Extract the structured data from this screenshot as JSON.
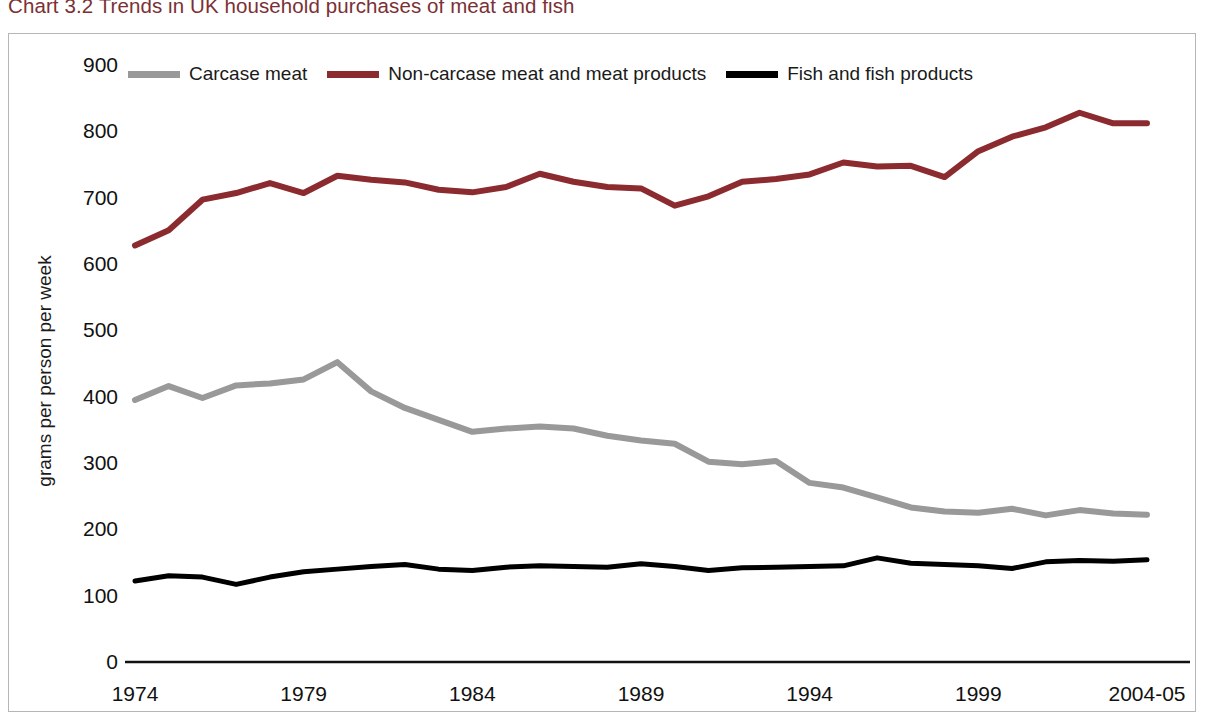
{
  "title": "Chart 3.2 Trends in UK household purchases of meat and fish",
  "title_color": "#7B3034",
  "legend": {
    "position": "top",
    "entries": [
      {
        "label": "Carcase meat",
        "color": "#999999"
      },
      {
        "label": "Non-carcase meat and meat products",
        "color": "#8C2B2F"
      },
      {
        "label": "Fish and fish products",
        "color": "#000000"
      }
    ]
  },
  "axes": {
    "ylabel": "grams per person per week",
    "xlabel": "",
    "y_ticks": [
      "900",
      "800",
      "700",
      "600",
      "500",
      "400",
      "300",
      "200",
      "100",
      "0"
    ],
    "x_ticks": [
      "1974",
      "1979",
      "1984",
      "1989",
      "1994",
      "1999",
      "2004-05"
    ]
  },
  "chart_data": {
    "type": "line",
    "title": "Chart 3.2 Trends in UK household purchases of meat and fish",
    "xlabel": "",
    "ylabel": "grams per person per week",
    "ylim": [
      0,
      900
    ],
    "grid": false,
    "legend_position": "top",
    "x": [
      "1974",
      "1975",
      "1976",
      "1977",
      "1978",
      "1979",
      "1980",
      "1981",
      "1982",
      "1983",
      "1984",
      "1985",
      "1986",
      "1987",
      "1988",
      "1989",
      "1990",
      "1991",
      "1992",
      "1993",
      "1994",
      "1995",
      "1996",
      "1997",
      "1998",
      "1999",
      "2000",
      "2001",
      "2002",
      "2003",
      "2004-05"
    ],
    "x_tick_labels": [
      "1974",
      "1979",
      "1984",
      "1989",
      "1994",
      "1999",
      "2004-05"
    ],
    "series": [
      {
        "name": "Carcase meat",
        "color": "#999999",
        "values": [
          395,
          416,
          398,
          417,
          420,
          426,
          452,
          408,
          383,
          365,
          347,
          352,
          355,
          352,
          341,
          334,
          329,
          302,
          298,
          303,
          270,
          263,
          248,
          233,
          227,
          225,
          231,
          221,
          229,
          224,
          222
        ]
      },
      {
        "name": "Non-carcase meat and meat products",
        "color": "#8C2B2F",
        "values": [
          628,
          651,
          697,
          707,
          722,
          707,
          733,
          727,
          723,
          712,
          708,
          716,
          736,
          724,
          716,
          714,
          688,
          702,
          724,
          728,
          735,
          753,
          747,
          748,
          731,
          770,
          792,
          806,
          828,
          812,
          812
        ]
      },
      {
        "name": "Fish and fish products",
        "color": "#000000",
        "values": [
          122,
          130,
          128,
          117,
          128,
          136,
          140,
          144,
          147,
          140,
          138,
          143,
          145,
          144,
          143,
          148,
          144,
          138,
          142,
          143,
          144,
          145,
          157,
          149,
          147,
          145,
          141,
          151,
          153,
          152,
          154
        ]
      }
    ]
  },
  "plot_geometry": {
    "x_left": 135,
    "x_right": 1147,
    "y_zero": 662,
    "y_nine_hundred": 65
  }
}
